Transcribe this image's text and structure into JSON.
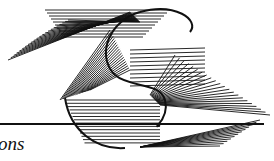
{
  "figure": {
    "type": "string-art S-curve envelope",
    "stroke_color": "#111111",
    "background": "#ffffff"
  },
  "caption": {
    "text": "ons"
  }
}
